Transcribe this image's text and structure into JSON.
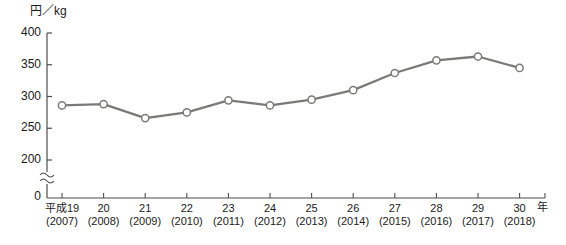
{
  "chart_data": {
    "type": "line",
    "title": "",
    "ylabel": "円／kg",
    "xlabel": "年",
    "ylim": [
      200,
      400
    ],
    "yticks": [
      200,
      250,
      300,
      350,
      400
    ],
    "ytick_labels": [
      "200",
      "250",
      "300",
      "350",
      "400"
    ],
    "zero_label": "0",
    "axis_break": true,
    "axis_break_symbol": "≈",
    "grid": false,
    "legend": null,
    "categories": [
      "平成19",
      "20",
      "21",
      "22",
      "23",
      "24",
      "25",
      "26",
      "27",
      "28",
      "29",
      "30"
    ],
    "categories_western": [
      "(2007)",
      "(2008)",
      "(2009)",
      "(2010)",
      "(2011)",
      "(2012)",
      "(2013)",
      "(2014)",
      "(2015)",
      "(2016)",
      "(2017)",
      "(2018)"
    ],
    "x": [
      2007,
      2008,
      2009,
      2010,
      2011,
      2012,
      2013,
      2014,
      2015,
      2016,
      2017,
      2018
    ],
    "values": [
      286,
      288,
      266,
      275,
      294,
      286,
      295,
      310,
      337,
      357,
      363,
      345
    ],
    "series": [
      {
        "name": "円／kg",
        "values": [
          286,
          288,
          266,
          275,
          294,
          286,
          295,
          310,
          337,
          357,
          363,
          345
        ]
      }
    ],
    "line_color": "#7a7a78",
    "marker_fill": "#ffffff",
    "marker_edge": "#7a7a78",
    "axis_color": "#4d4d4d"
  },
  "colors": {
    "line": "#7a7a78",
    "marker_fill": "#ffffff",
    "marker_edge": "#7a7a78",
    "axis": "#4d4d4d",
    "text": "#1a1a1a",
    "background": "#ffffff"
  }
}
